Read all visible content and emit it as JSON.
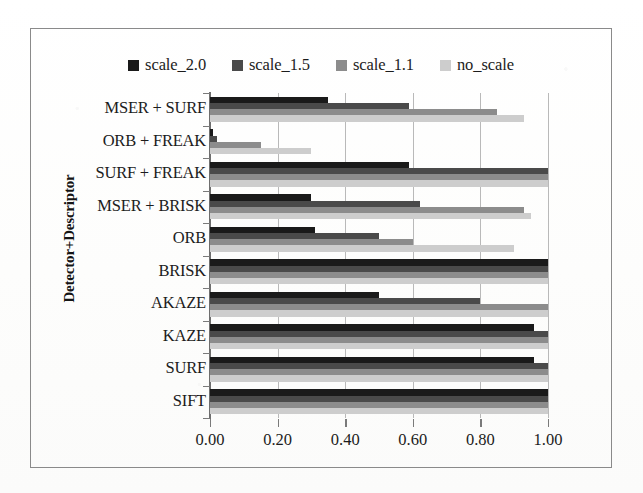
{
  "chart_data": {
    "type": "bar",
    "orientation": "horizontal",
    "title": "",
    "xlabel": "",
    "ylabel": "Detector+Descriptor",
    "xlim": [
      0.0,
      1.0
    ],
    "xticks": [
      "0.00",
      "0.20",
      "0.40",
      "0.60",
      "0.80",
      "1.00"
    ],
    "xtick_values": [
      0.0,
      0.2,
      0.4,
      0.6,
      0.8,
      1.0
    ],
    "grid": true,
    "legend_position": "top",
    "categories": [
      "MSER + SURF",
      "ORB + FREAK",
      "SURF + FREAK",
      "MSER + BRISK",
      "ORB",
      "BRISK",
      "AKAZE",
      "KAZE",
      "SURF",
      "SIFT"
    ],
    "series": [
      {
        "name": "scale_2.0",
        "color": "#1a1a1a",
        "values": [
          0.35,
          0.01,
          0.59,
          0.3,
          0.31,
          1.0,
          0.5,
          0.96,
          0.96,
          1.0
        ]
      },
      {
        "name": "scale_1.5",
        "color": "#4a4a4a",
        "values": [
          0.59,
          0.02,
          1.0,
          0.62,
          0.5,
          1.0,
          0.8,
          1.0,
          1.0,
          1.0
        ]
      },
      {
        "name": "scale_1.1",
        "color": "#8c8c8c",
        "values": [
          0.85,
          0.15,
          1.0,
          0.93,
          0.6,
          1.0,
          1.0,
          1.0,
          1.0,
          1.0
        ]
      },
      {
        "name": "no_scale",
        "color": "#cdcdcd",
        "values": [
          0.93,
          0.3,
          1.0,
          0.95,
          0.9,
          1.0,
          1.0,
          1.0,
          1.0,
          1.0
        ]
      }
    ]
  },
  "legend": {
    "items": [
      {
        "label": "scale_2.0",
        "color": "#1a1a1a"
      },
      {
        "label": "scale_1.5",
        "color": "#4a4a4a"
      },
      {
        "label": "scale_1.1",
        "color": "#8c8c8c"
      },
      {
        "label": "no_scale",
        "color": "#cdcdcd"
      }
    ]
  },
  "axis": {
    "y_title": "Detector+Descriptor"
  }
}
